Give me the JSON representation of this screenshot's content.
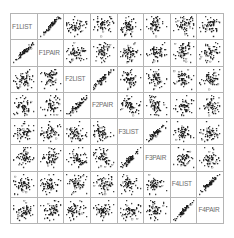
{
  "figure": {
    "type": "scatterplot-matrix",
    "title": "",
    "background_color": "#ffffff",
    "grid_line_color": "#b4b4b4",
    "label_color": "#6b6b6b",
    "marker_color": "#1a1a1a",
    "marker_shape": "open-square",
    "variables": [
      "F1LIST",
      "F1PAIR",
      "F2LIST",
      "F2PAIR",
      "F3LIST",
      "F3PAIR",
      "F4LIST",
      "F4PAIR"
    ]
  },
  "chart_data": {
    "type": "scatter",
    "title": "",
    "xlabel": "",
    "ylabel": "",
    "layout": "matrix",
    "rows": 8,
    "cols": 8,
    "grid": true,
    "legend": "none",
    "diagonal_content": "variable-name",
    "variables": [
      "F1LIST",
      "F1PAIR",
      "F2LIST",
      "F2PAIR",
      "F3LIST",
      "F3PAIR",
      "F4LIST",
      "F4PAIR"
    ],
    "n_points_per_panel": 60,
    "axis_ranges": {
      "F1LIST": [
        0,
        1
      ],
      "F1PAIR": [
        0,
        1
      ],
      "F2LIST": [
        0,
        1
      ],
      "F2PAIR": [
        0,
        1
      ],
      "F3LIST": [
        0,
        1
      ],
      "F3PAIR": [
        0,
        1
      ],
      "F4LIST": [
        0,
        1
      ],
      "F4PAIR": [
        0,
        1
      ]
    },
    "correlation_matrix": [
      [
        1.0,
        0.96,
        0.22,
        0.18,
        0.2,
        0.16,
        0.18,
        0.21
      ],
      [
        0.96,
        1.0,
        0.19,
        0.21,
        0.17,
        0.19,
        0.2,
        0.17
      ],
      [
        0.22,
        0.19,
        1.0,
        0.95,
        0.21,
        0.18,
        0.19,
        0.23
      ],
      [
        0.18,
        0.21,
        0.95,
        1.0,
        0.18,
        0.2,
        0.22,
        0.19
      ],
      [
        0.2,
        0.17,
        0.21,
        0.18,
        1.0,
        0.94,
        0.2,
        0.18
      ],
      [
        0.16,
        0.19,
        0.18,
        0.2,
        0.94,
        1.0,
        0.19,
        0.21
      ],
      [
        0.18,
        0.2,
        0.19,
        0.22,
        0.2,
        0.19,
        1.0,
        0.95
      ],
      [
        0.21,
        0.17,
        0.23,
        0.19,
        0.18,
        0.21,
        0.95,
        1.0
      ]
    ]
  }
}
